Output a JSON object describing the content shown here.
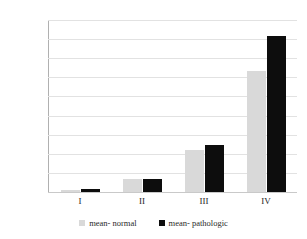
{
  "chart_data": {
    "type": "bar",
    "title": "",
    "subtitle": "",
    "xlabel": "",
    "ylabel": "",
    "categories": [
      "I",
      "II",
      "III",
      "IV"
    ],
    "series": [
      {
        "name": "mean- normal",
        "color": "#d9d9d9",
        "values": [
          60,
          330,
          1110,
          3170
        ]
      },
      {
        "name": "mean- pathologic",
        "color": "#0d0d0d",
        "values": [
          70,
          335,
          1240,
          4070
        ]
      }
    ],
    "ylim": [
      0,
      4500
    ],
    "ytick_labels": [
      "0",
      "500",
      "1000",
      "1500",
      "2000",
      "2500",
      "3000",
      "3500",
      "4000",
      "4500"
    ],
    "ytick_values": [
      0,
      500,
      1000,
      1500,
      2000,
      2500,
      3000,
      3500,
      4000,
      4500
    ],
    "grid": true,
    "legend_position": "bottom"
  }
}
